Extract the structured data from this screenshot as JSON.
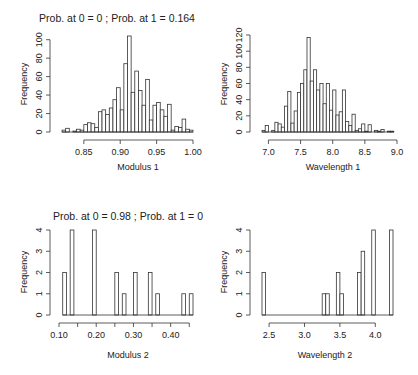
{
  "chart_data": [
    {
      "type": "bar",
      "id": "modulus1",
      "title": "Prob. at 0 = 0 ; Prob. at 1 = 0.164",
      "xlabel": "Modulus 1",
      "ylabel": "Frequency",
      "bin_start": 0.82,
      "bin_width": 0.005,
      "values": [
        2,
        4,
        0,
        1,
        3,
        2,
        8,
        10,
        9,
        5,
        22,
        24,
        19,
        26,
        35,
        48,
        24,
        74,
        104,
        43,
        66,
        45,
        29,
        57,
        13,
        29,
        32,
        24,
        17,
        30,
        2,
        6,
        5,
        14,
        3,
        2
      ],
      "xticks": [
        0.85,
        0.9,
        0.95,
        1.0
      ],
      "xtick_labels": [
        "0.85",
        "0.90",
        "0.95",
        "1.00"
      ],
      "yticks": [
        0,
        20,
        40,
        60,
        80,
        100
      ],
      "xlim": [
        0.82,
        1.0
      ],
      "ylim": [
        0,
        104
      ],
      "grid": false
    },
    {
      "type": "bar",
      "id": "wavelength1",
      "title": "",
      "xlabel": "Wavelength 1",
      "ylabel": "Frequency",
      "bin_start": 6.9,
      "bin_width": 0.05,
      "values": [
        2,
        8,
        0,
        2,
        12,
        10,
        6,
        32,
        50,
        11,
        26,
        49,
        60,
        77,
        117,
        63,
        77,
        52,
        60,
        35,
        60,
        27,
        52,
        21,
        25,
        52,
        13,
        8,
        22,
        2,
        4,
        10,
        1,
        9,
        0,
        2,
        1,
        3,
        0,
        1,
        1
      ],
      "xticks": [
        7.0,
        7.5,
        8.0,
        8.5,
        9.0
      ],
      "xtick_labels": [
        "7.0",
        "7.5",
        "8.0",
        "8.5",
        "9.0"
      ],
      "yticks": [
        0,
        20,
        40,
        60,
        80,
        100,
        120
      ],
      "xlim": [
        6.9,
        9.0
      ],
      "ylim": [
        0,
        120
      ],
      "grid": false
    },
    {
      "type": "bar",
      "id": "modulus2",
      "title": "Prob. at 0 = 0.98 ; Prob. at 1 = 0",
      "xlabel": "Modulus 2",
      "ylabel": "Frequency",
      "bin_start": 0.11,
      "bin_width": 0.01,
      "values": [
        2,
        0,
        4,
        0,
        0,
        0,
        0,
        0,
        4,
        0,
        0,
        0,
        0,
        0,
        2,
        0,
        1,
        0,
        0,
        2,
        0,
        0,
        0,
        2,
        0,
        1,
        0,
        0,
        0,
        0,
        0,
        0,
        1,
        0,
        1
      ],
      "xticks": [
        0.1,
        0.15,
        0.2,
        0.25,
        0.3,
        0.35,
        0.4,
        0.45
      ],
      "xtick_labels": [
        "0.10",
        "",
        "0.20",
        "",
        "0.30",
        "",
        "0.40",
        ""
      ],
      "yticks": [
        0,
        1,
        2,
        3,
        4
      ],
      "xlim": [
        0.1,
        0.46
      ],
      "ylim": [
        0,
        4
      ],
      "grid": false
    },
    {
      "type": "bar",
      "id": "wavelength2",
      "title": "",
      "xlabel": "Wavelength 2",
      "ylabel": "Frequency",
      "bin_start": 2.4,
      "bin_width": 0.05,
      "values": [
        2,
        0,
        0,
        0,
        0,
        0,
        0,
        0,
        0,
        0,
        0,
        0,
        0,
        0,
        0,
        0,
        0,
        1,
        1,
        0,
        0,
        2,
        1,
        0,
        0,
        0,
        0,
        2,
        3,
        0,
        0,
        4,
        0,
        0,
        0,
        0,
        4
      ],
      "xticks": [
        2.5,
        3.0,
        3.5,
        4.0
      ],
      "xtick_labels": [
        "2.5",
        "3.0",
        "3.5",
        "4.0"
      ],
      "yticks": [
        0,
        1,
        2,
        3,
        4
      ],
      "xlim": [
        2.4,
        4.25
      ],
      "ylim": [
        0,
        4
      ],
      "grid": false
    }
  ],
  "panels": [
    {
      "title": "Prob. at 0 = 0 ; Prob. at 1 = 0.164",
      "xlabel": "Modulus 1",
      "ylabel": "Frequency"
    },
    {
      "title": "",
      "xlabel": "Wavelength 1",
      "ylabel": "Frequency"
    },
    {
      "title": "Prob. at 0 = 0.98 ; Prob. at 1 = 0",
      "xlabel": "Modulus 2",
      "ylabel": "Frequency"
    },
    {
      "title": "",
      "xlabel": "Wavelength 2",
      "ylabel": "Frequency"
    }
  ]
}
